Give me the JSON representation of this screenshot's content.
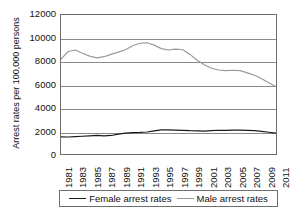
{
  "chart_data": {
    "type": "line",
    "title": "",
    "xlabel": "",
    "ylabel": "Arrest rates per 100,000 persons",
    "ylim": [
      0,
      12000
    ],
    "ytick_labels": [
      "12000",
      "10000",
      "8000",
      "6000",
      "4000",
      "2000",
      "0"
    ],
    "ytick_values": [
      12000,
      10000,
      8000,
      6000,
      4000,
      2000,
      0
    ],
    "grid": true,
    "legend_position": "bottom",
    "x": [
      1981,
      1982,
      1983,
      1984,
      1985,
      1986,
      1987,
      1988,
      1989,
      1990,
      1991,
      1992,
      1993,
      1994,
      1995,
      1996,
      1997,
      1998,
      1999,
      2000,
      2001,
      2002,
      2003,
      2004,
      2005,
      2006,
      2007,
      2008,
      2009,
      2010,
      2011
    ],
    "xtick_labels": [
      "1981",
      "1983",
      "1985",
      "1987",
      "1989",
      "1991",
      "1993",
      "1995",
      "1997",
      "1999",
      "2001",
      "2003",
      "2005",
      "2007",
      "2009",
      "2011"
    ],
    "xtick_values": [
      1981,
      1983,
      1985,
      1987,
      1989,
      1991,
      1993,
      1995,
      1997,
      1999,
      2001,
      2003,
      2005,
      2007,
      2009,
      2011
    ],
    "series": [
      {
        "name": "Female arrest rates",
        "color": "#1a1a1a",
        "values": [
          1480,
          1470,
          1500,
          1530,
          1570,
          1600,
          1560,
          1600,
          1720,
          1800,
          1840,
          1860,
          1900,
          2000,
          2080,
          2090,
          2060,
          2040,
          2010,
          2000,
          1980,
          2020,
          2050,
          2040,
          2060,
          2060,
          2040,
          2020,
          1960,
          1880,
          1800
        ]
      },
      {
        "name": "Male arrest rates",
        "color": "#9a9a9a",
        "values": [
          8200,
          8850,
          8980,
          8700,
          8450,
          8300,
          8400,
          8600,
          8800,
          9000,
          9350,
          9560,
          9600,
          9400,
          9100,
          8980,
          9050,
          9000,
          8600,
          8100,
          7700,
          7400,
          7250,
          7200,
          7230,
          7200,
          7000,
          6800,
          6500,
          6150,
          5820
        ]
      }
    ],
    "legend": [
      {
        "label": "Female arrest rates",
        "color": "#1a1a1a"
      },
      {
        "label": "Male arrest rates",
        "color": "#9a9a9a"
      }
    ]
  }
}
